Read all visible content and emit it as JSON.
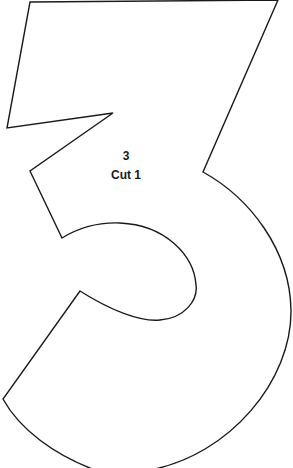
{
  "template": {
    "shape": "number-3-outline",
    "number_label": "3",
    "cut_label": "Cut 1",
    "outline_color": "#1a1a1a",
    "background_color": "#ffffff",
    "smudge": "pencil-shading-mark"
  }
}
